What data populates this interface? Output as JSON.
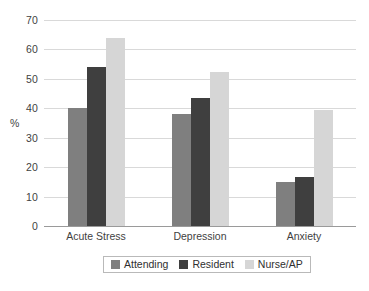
{
  "chart_data": {
    "type": "bar",
    "title": "",
    "subtitle": "",
    "xlabel": "",
    "ylabel": "%",
    "ylim": [
      0,
      70
    ],
    "ytick_step": 10,
    "yticks": [
      0,
      10,
      20,
      30,
      40,
      50,
      60,
      70
    ],
    "ytick_labels": [
      "0",
      "10",
      "20",
      "30",
      "40",
      "50",
      "60",
      "70"
    ],
    "grid": "horizontal",
    "legend_position": "bottom",
    "categories": [
      "Acute Stress",
      "Depression",
      "Anxiety"
    ],
    "series": [
      {
        "name": "Attending",
        "color": "#7f7f7f",
        "values": [
          40,
          38,
          15
        ]
      },
      {
        "name": "Resident",
        "color": "#3f3f3f",
        "values": [
          54,
          43.5,
          16.8
        ]
      },
      {
        "name": "Nurse/AP",
        "color": "#d6d6d6",
        "values": [
          64,
          52.5,
          39.5
        ]
      }
    ]
  },
  "legend": {
    "items": [
      {
        "label": "Attending"
      },
      {
        "label": "Resident"
      },
      {
        "label": "Nurse/AP"
      }
    ]
  },
  "axis": {
    "y_title": "%"
  },
  "colors": {
    "gridline": "#d9d9d9",
    "baseline": "#9a9a9a",
    "text": "#3f3f3f",
    "legend_border": "#b9b9b9",
    "background": "#ffffff"
  }
}
